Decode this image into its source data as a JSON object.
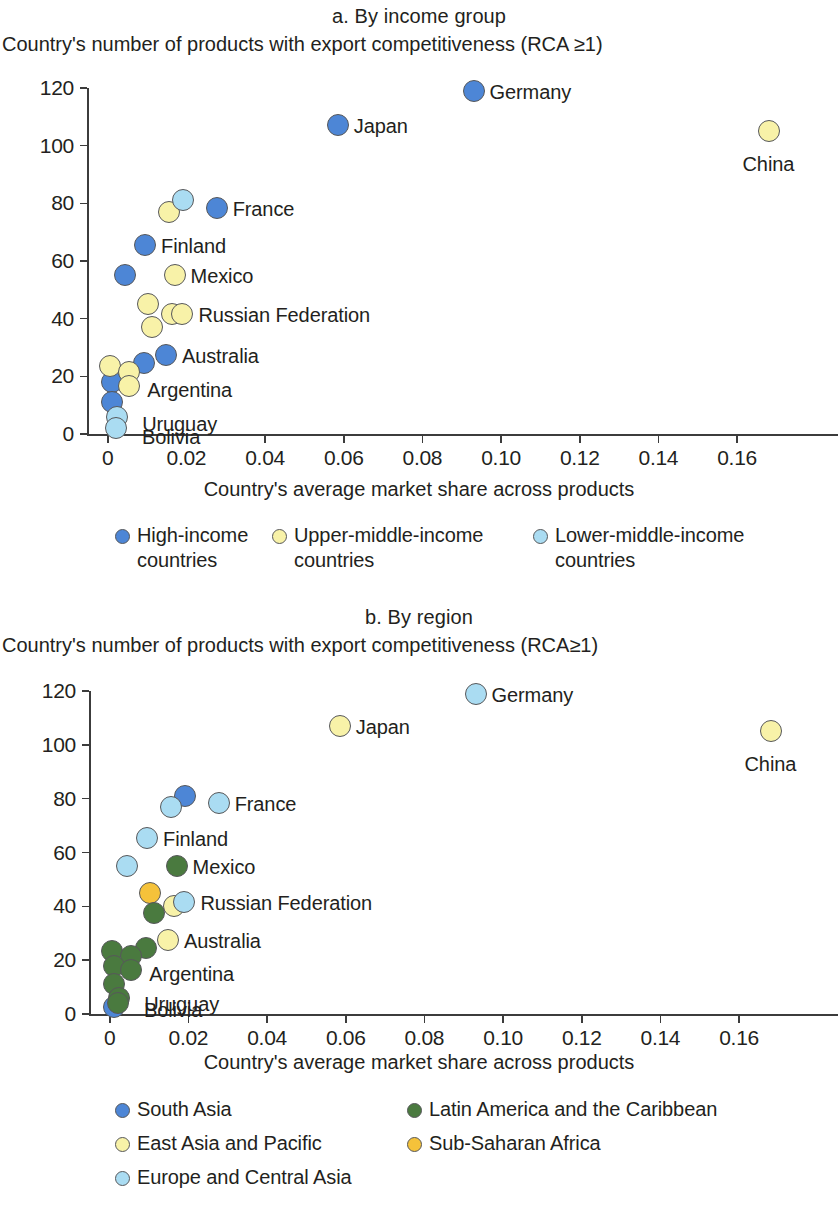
{
  "panel_a": {
    "title": "a. By income group",
    "y_axis_title": "Country's number of products with export competitiveness (RCA ≥1)",
    "x_axis_title": "Country's average market share across products",
    "legend": [
      {
        "label": "High-income\ncountries",
        "color": "#4d86d6"
      },
      {
        "label": "Upper-middle-income\ncountries",
        "color": "#f8f2a8"
      },
      {
        "label": "Lower-middle-income\ncountries",
        "color": "#aadcf2"
      }
    ]
  },
  "panel_b": {
    "title": "b. By region",
    "y_axis_title": "Country's number of products with export competitiveness (RCA≥1)",
    "x_axis_title": "Country's average market share across products",
    "legend": [
      {
        "label": "South Asia",
        "color": "#4d86d6"
      },
      {
        "label": "Latin America and the Caribbean",
        "color": "#4a7a3f"
      },
      {
        "label": "East Asia and Pacific",
        "color": "#f8f2a8"
      },
      {
        "label": "Sub-Saharan Africa",
        "color": "#f5c23a"
      },
      {
        "label": "Europe and Central Asia",
        "color": "#aadcf2"
      }
    ]
  },
  "chart_data": [
    {
      "type": "scatter",
      "title": "a. By income group",
      "xlabel": "Country's average market share across products",
      "ylabel": "Country's number of products with export competitiveness (RCA ≥1)",
      "xlim": [
        -0.004,
        0.176
      ],
      "ylim": [
        0,
        120
      ],
      "xticks": [
        "0",
        "0.02",
        "0.04",
        "0.06",
        "0.08",
        "0.10",
        "0.12",
        "0.14",
        "0.16"
      ],
      "xtick_values": [
        0,
        0.02,
        0.04,
        0.06,
        0.08,
        0.1,
        0.12,
        0.14,
        0.16
      ],
      "yticks": [
        "0",
        "20",
        "40",
        "60",
        "80",
        "100",
        "120"
      ],
      "ytick_values": [
        0,
        20,
        40,
        60,
        80,
        100,
        120
      ],
      "grid": false,
      "legend_position": "below",
      "series": [
        {
          "name": "High-income countries",
          "color": "#4d86d6",
          "points": [
            {
              "x": 0.093,
              "y": 119,
              "label": "Germany"
            },
            {
              "x": 0.0585,
              "y": 107,
              "label": "Japan"
            },
            {
              "x": 0.0277,
              "y": 78.5,
              "label": "France"
            },
            {
              "x": 0.0095,
              "y": 65.5,
              "label": "Finland"
            },
            {
              "x": 0.0045,
              "y": 55,
              "label": ""
            },
            {
              "x": 0.0148,
              "y": 27.5,
              "label": "Australia"
            },
            {
              "x": 0.0092,
              "y": 24.5,
              "label": ""
            },
            {
              "x": 0.0011,
              "y": 18,
              "label": ""
            },
            {
              "x": 0.0011,
              "y": 11,
              "label": ""
            }
          ]
        },
        {
          "name": "Upper-middle-income countries",
          "color": "#f8f2a8",
          "points": [
            {
              "x": 0.168,
              "y": 105,
              "label": "China"
            },
            {
              "x": 0.0155,
              "y": 77,
              "label": ""
            },
            {
              "x": 0.017,
              "y": 55,
              "label": "Mexico"
            },
            {
              "x": 0.0103,
              "y": 45,
              "label": ""
            },
            {
              "x": 0.0163,
              "y": 41.5,
              "label": ""
            },
            {
              "x": 0.019,
              "y": 41.5,
              "label": "Russian Federation"
            },
            {
              "x": 0.0113,
              "y": 37,
              "label": ""
            },
            {
              "x": 0.0007,
              "y": 23.5,
              "label": ""
            },
            {
              "x": 0.0055,
              "y": 21.5,
              "label": ""
            },
            {
              "x": 0.0055,
              "y": 16.5,
              "label": "Argentina"
            }
          ]
        },
        {
          "name": "Lower-middle-income countries",
          "color": "#aadcf2",
          "points": [
            {
              "x": 0.0192,
              "y": 81,
              "label": ""
            },
            {
              "x": 0.0024,
              "y": 6,
              "label": "Uruguay"
            },
            {
              "x": 0.0021,
              "y": 2,
              "label": "Bolivia"
            }
          ]
        }
      ]
    },
    {
      "type": "scatter",
      "title": "b. By region",
      "xlabel": "Country's average market share across products",
      "ylabel": "Country's number of products with export competitiveness (RCA≥1)",
      "xlim": [
        -0.004,
        0.176
      ],
      "ylim": [
        0,
        120
      ],
      "xticks": [
        "0",
        "0.02",
        "0.04",
        "0.06",
        "0.08",
        "0.10",
        "0.12",
        "0.14",
        "0.16"
      ],
      "xtick_values": [
        0,
        0.02,
        0.04,
        0.06,
        0.08,
        0.1,
        0.12,
        0.14,
        0.16
      ],
      "yticks": [
        "0",
        "20",
        "40",
        "60",
        "80",
        "100",
        "120"
      ],
      "ytick_values": [
        0,
        20,
        40,
        60,
        80,
        100,
        120
      ],
      "grid": false,
      "legend_position": "below",
      "series": [
        {
          "name": "South Asia",
          "color": "#4d86d6",
          "points": [
            {
              "x": 0.0192,
              "y": 81,
              "label": ""
            },
            {
              "x": 0.0011,
              "y": 2.5,
              "label": ""
            }
          ]
        },
        {
          "name": "East Asia and Pacific",
          "color": "#f8f2a8",
          "points": [
            {
              "x": 0.0585,
              "y": 107,
              "label": "Japan"
            },
            {
              "x": 0.168,
              "y": 105,
              "label": "China"
            },
            {
              "x": 0.0163,
              "y": 40,
              "label": ""
            },
            {
              "x": 0.0148,
              "y": 27.5,
              "label": "Australia"
            }
          ]
        },
        {
          "name": "Europe and Central Asia",
          "color": "#aadcf2",
          "points": [
            {
              "x": 0.093,
              "y": 119,
              "label": "Germany"
            },
            {
              "x": 0.0277,
              "y": 78.5,
              "label": "France"
            },
            {
              "x": 0.0155,
              "y": 77,
              "label": ""
            },
            {
              "x": 0.0095,
              "y": 65.5,
              "label": "Finland"
            },
            {
              "x": 0.0045,
              "y": 55,
              "label": ""
            },
            {
              "x": 0.019,
              "y": 41.5,
              "label": "Russian Federation"
            }
          ]
        },
        {
          "name": "Sub-Saharan Africa",
          "color": "#f5c23a",
          "points": [
            {
              "x": 0.0103,
              "y": 45,
              "label": ""
            }
          ]
        },
        {
          "name": "Latin America and the Caribbean",
          "color": "#4a7a3f",
          "points": [
            {
              "x": 0.017,
              "y": 55,
              "label": "Mexico"
            },
            {
              "x": 0.0113,
              "y": 37.5,
              "label": ""
            },
            {
              "x": 0.0092,
              "y": 24.5,
              "label": ""
            },
            {
              "x": 0.0007,
              "y": 23.5,
              "label": ""
            },
            {
              "x": 0.0055,
              "y": 21.5,
              "label": ""
            },
            {
              "x": 0.0011,
              "y": 18,
              "label": ""
            },
            {
              "x": 0.0055,
              "y": 16.5,
              "label": "Argentina"
            },
            {
              "x": 0.0011,
              "y": 11,
              "label": ""
            },
            {
              "x": 0.0024,
              "y": 6,
              "label": "Uruguay"
            },
            {
              "x": 0.0021,
              "y": 4,
              "label": "Bolivia"
            }
          ]
        }
      ]
    }
  ]
}
